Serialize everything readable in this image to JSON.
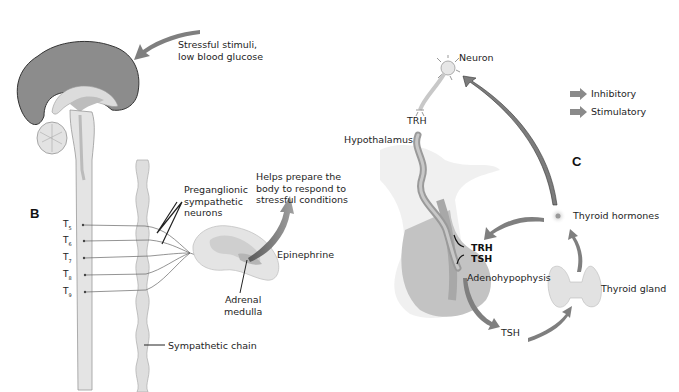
{
  "panels": {
    "B": {
      "letter": "B",
      "stimulus_label_line1": "Stressful stimuli,",
      "stimulus_label_line2": "low blood glucose",
      "preganglionic_line1": "Preganglionic",
      "preganglionic_line2": "sympathetic",
      "preganglionic_line3": "neurons",
      "helps_line1": "Helps prepare the",
      "helps_line2": "body to respond to",
      "helps_line3": "stressful conditions",
      "epinephrine": "Epinephrine",
      "adrenal_line1": "Adrenal",
      "adrenal_line2": "medulla",
      "sympathetic_chain": "Sympathetic chain",
      "spinal_levels": [
        {
          "base": "T",
          "sub": "5"
        },
        {
          "base": "T",
          "sub": "6"
        },
        {
          "base": "T",
          "sub": "7"
        },
        {
          "base": "T",
          "sub": "8"
        },
        {
          "base": "T",
          "sub": "9"
        }
      ]
    },
    "C": {
      "letter": "C",
      "neuron": "Neuron",
      "trh_top": "TRH",
      "hypothalamus": "Hypothalamus",
      "trh_inner": "TRH",
      "tsh_inner": "TSH",
      "adenohypophysis": "Adenohypophysis",
      "tsh_bottom": "TSH",
      "thyroid_gland": "Thyroid gland",
      "thyroid_hormones": "Thyroid hormones",
      "legend": [
        {
          "label": "Inhibitory",
          "color": "#8a8a8a"
        },
        {
          "label": "Stimulatory",
          "color": "#8a8a8a"
        }
      ]
    }
  },
  "colors": {
    "brain_cortex": "#8c8c8c",
    "brain_light": "#d9d9d9",
    "tissue_light": "#e4e4e4",
    "arrow_gray": "#7f7f7f",
    "pituitary": "#bdbdbd"
  }
}
